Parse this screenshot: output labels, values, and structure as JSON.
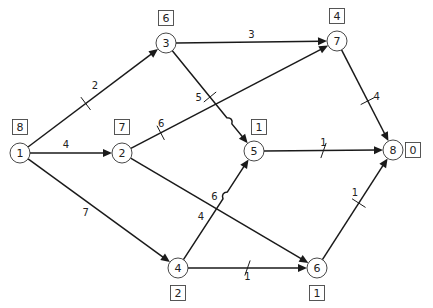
{
  "diagram": {
    "type": "activity-network",
    "nodes": [
      {
        "id": "1",
        "label": "1",
        "box": "8"
      },
      {
        "id": "2",
        "label": "2",
        "box": "7"
      },
      {
        "id": "3",
        "label": "3",
        "box": "6"
      },
      {
        "id": "4",
        "label": "4",
        "box": "2"
      },
      {
        "id": "5",
        "label": "5",
        "box": "1"
      },
      {
        "id": "6",
        "label": "6",
        "box": "1"
      },
      {
        "id": "7",
        "label": "7",
        "box": "4"
      },
      {
        "id": "8",
        "label": "8",
        "box": "0"
      }
    ],
    "edges": [
      {
        "from": "1",
        "to": "3",
        "weight": "2",
        "marked": true
      },
      {
        "from": "1",
        "to": "2",
        "weight": "4",
        "marked": false
      },
      {
        "from": "1",
        "to": "4",
        "weight": "7",
        "marked": false
      },
      {
        "from": "3",
        "to": "7",
        "weight": "3",
        "marked": false
      },
      {
        "from": "3",
        "to": "5",
        "weight": "5",
        "marked": true
      },
      {
        "from": "2",
        "to": "7",
        "weight": "6",
        "marked": true
      },
      {
        "from": "2",
        "to": "6",
        "weight": "6",
        "marked": false
      },
      {
        "from": "4",
        "to": "5",
        "weight": "4",
        "marked": false
      },
      {
        "from": "4",
        "to": "6",
        "weight": "1",
        "marked": true
      },
      {
        "from": "5",
        "to": "8",
        "weight": "1",
        "marked": true
      },
      {
        "from": "7",
        "to": "8",
        "weight": "4",
        "marked": true
      },
      {
        "from": "6",
        "to": "8",
        "weight": "1",
        "marked": true
      }
    ]
  }
}
